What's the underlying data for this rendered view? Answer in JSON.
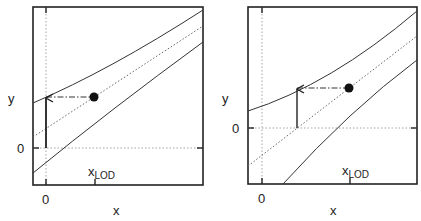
{
  "panels": [
    {
      "id": "left",
      "y_label": "y",
      "x_label": "x",
      "y_zero_label": "0",
      "x_zero_label": "0",
      "xlod_label": "x",
      "xlod_sub": "LOD"
    },
    {
      "id": "right",
      "y_label": "y",
      "x_label": "x",
      "y_zero_label": "0",
      "x_zero_label": "0",
      "xlod_label": "x",
      "xlod_sub": "LOD"
    }
  ],
  "colors": {
    "line": "#333333",
    "dotted": "#888888",
    "frame": "#222222"
  }
}
